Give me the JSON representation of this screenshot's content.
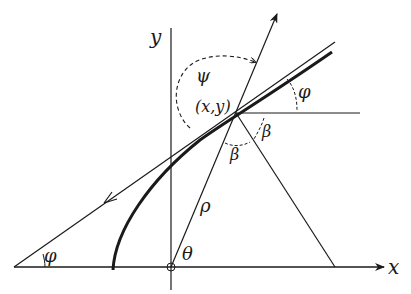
{
  "diagram": {
    "colors": {
      "ink": "#1a1a1a",
      "background": "#ffffff"
    },
    "labels": {
      "y_axis": "y",
      "x_axis": "x",
      "point": "(x,y)",
      "psi": "ψ",
      "phi_top": "φ",
      "phi_bottom": "φ",
      "beta_right": "β",
      "beta_lower": "β",
      "rho": "ρ",
      "theta": "θ"
    },
    "geometry": {
      "origin": [
        171,
        267
      ],
      "point": [
        236,
        113
      ],
      "x_axis": {
        "from": [
          14,
          267
        ],
        "to": [
          384,
          267
        ]
      },
      "y_axis": {
        "from": [
          171,
          28
        ],
        "to": [
          171,
          290
        ]
      },
      "curve": {
        "start": [
          113,
          270
        ],
        "end": [
          332,
          52
        ]
      },
      "tangent": {
        "from": [
          14,
          267
        ],
        "to": [
          335,
          42
        ]
      },
      "normal_up": {
        "from": [
          171,
          267
        ],
        "to": [
          277,
          12
        ]
      },
      "horizontal": {
        "from": [
          236,
          113
        ],
        "to": [
          360,
          113
        ]
      },
      "normal_down": {
        "from": [
          236,
          113
        ],
        "to": [
          335,
          267
        ]
      }
    }
  }
}
